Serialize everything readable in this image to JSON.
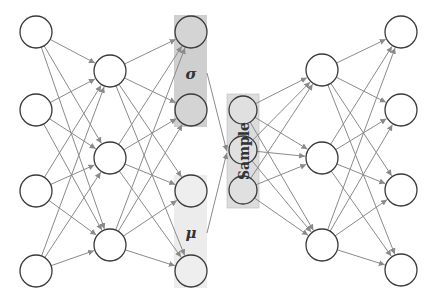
{
  "diagram": {
    "type": "variational-autoencoder",
    "colors": {
      "sigma_box": "#cfcfcf",
      "mu_box": "#ececec",
      "sample_box": "#dcdcdc",
      "edge": "#8a8a8a",
      "node_stroke": "#3a3a3a",
      "latent_node_fill": "#e4e4e4"
    },
    "labels": {
      "sigma": "σ",
      "mu": "μ",
      "sample": "Sample"
    },
    "layers": [
      {
        "name": "encoder-input",
        "nodes": 4
      },
      {
        "name": "encoder-hidden",
        "nodes": 3
      },
      {
        "name": "sigma",
        "nodes": 2
      },
      {
        "name": "mu",
        "nodes": 2
      },
      {
        "name": "sample",
        "nodes": 3
      },
      {
        "name": "decoder-hidden",
        "nodes": 3
      },
      {
        "name": "decoder-output",
        "nodes": 4
      }
    ]
  }
}
